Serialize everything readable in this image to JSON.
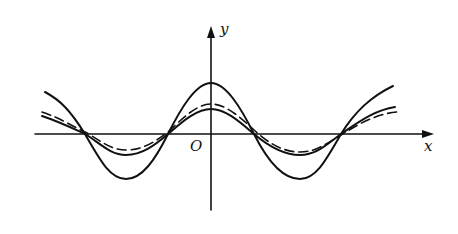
{
  "figure": {
    "type": "function-graph",
    "labels": {
      "x_axis": "x",
      "y_axis": "y",
      "origin": "O"
    },
    "colors": {
      "stroke": "#111111",
      "background": "#ffffff"
    },
    "curves": [
      {
        "name": "tall-solid-curve",
        "style": "solid",
        "relative_amplitude": 1.0
      },
      {
        "name": "dashed-curve",
        "style": "dashed",
        "relative_amplitude": 0.6
      },
      {
        "name": "short-solid-curve",
        "style": "solid",
        "relative_amplitude": 0.5
      }
    ]
  }
}
